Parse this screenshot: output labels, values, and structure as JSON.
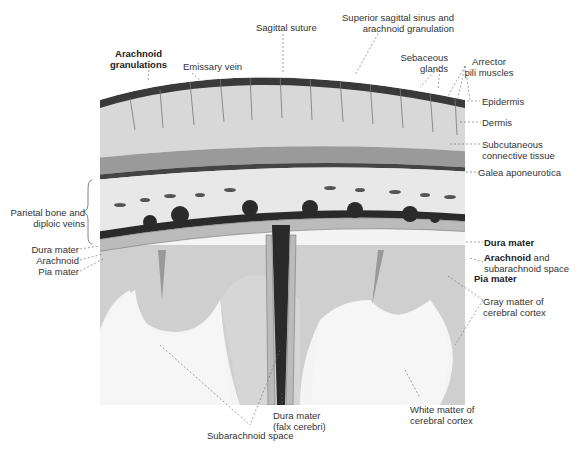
{
  "figure": {
    "colors": {
      "skin": "#d4d4d4",
      "bone": "#e6e6e6",
      "dura": "#2a2a2a",
      "gray_matter": "#cfcfcf",
      "white_matter": "#f4f4f4",
      "label_text": "#333333"
    }
  },
  "labels": {
    "arachnoid_granulations": [
      "Arachnoid",
      "granulations"
    ],
    "emissary_vein": "Emissary vein",
    "sagittal_suture": "Sagittal suture",
    "superior_sagittal_sinus": [
      "Superior sagittal sinus and",
      "arachnoid granulation"
    ],
    "sebaceous_glands": [
      "Sebaceous",
      "glands"
    ],
    "arrector_pili": [
      "Arrector",
      "pili muscles"
    ],
    "epidermis": "Epidermis",
    "dermis": "Dermis",
    "subcutaneous": [
      "Subcutaneous",
      "connective tissue"
    ],
    "galea": "Galea aponeurotica",
    "parietal_bone": [
      "Parietal bone and",
      "diploic veins"
    ],
    "dura_left": "Dura mater",
    "arachnoid_left": "Arachnoid",
    "pia_left": "Pia mater",
    "dura_right": "Dura mater",
    "arachnoid_right_bold": "Arachnoid",
    "arachnoid_right_rest": " and",
    "arachnoid_right_line2": "subarachnoid space",
    "pia_right": "Pia mater",
    "gray_matter": [
      "Gray matter of",
      "cerebral cortex"
    ],
    "white_matter": [
      "White matter of",
      "cerebral cortex"
    ],
    "falx": [
      "Dura mater",
      "(falx cerebri)"
    ],
    "subarachnoid_space": "Subarachnoid space"
  }
}
